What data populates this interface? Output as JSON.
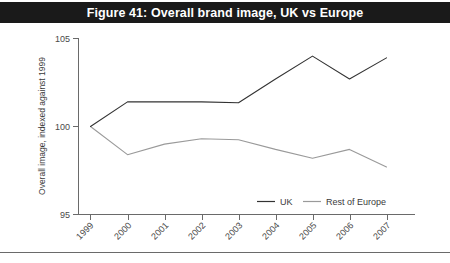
{
  "figure": {
    "title": "Figure 41: Overall brand image, UK vs Europe",
    "title_bg": "#1a1a1a",
    "title_fg": "#ffffff"
  },
  "chart_data": {
    "type": "line",
    "title": "Figure 41: Overall brand image, UK vs Europe",
    "xlabel": "",
    "ylabel": "Overall image, indexed against 1999",
    "categories": [
      "1999",
      "2000",
      "2001",
      "2002",
      "2003",
      "2004",
      "2005",
      "2006",
      "2007"
    ],
    "x_tick_labels": [
      "1999",
      "2000",
      "2001",
      "2002",
      "2003",
      "2004",
      "2005",
      "2006",
      "2007"
    ],
    "y_tick_labels": [
      "95",
      "100",
      "105"
    ],
    "y_ticks": [
      95,
      100,
      105
    ],
    "ylim": [
      95,
      105
    ],
    "grid": false,
    "legend_position": "bottom-right",
    "series": [
      {
        "name": "UK",
        "color": "#333333",
        "values": [
          100.0,
          101.4,
          101.4,
          101.4,
          101.35,
          102.7,
          104.0,
          102.7,
          103.9
        ]
      },
      {
        "name": "Rest of Europe",
        "color": "#9a9a9a",
        "values": [
          100.0,
          98.4,
          99.0,
          99.3,
          99.25,
          98.7,
          98.2,
          98.7,
          97.7
        ]
      }
    ]
  },
  "legend": {
    "items": [
      {
        "label": "UK",
        "color": "#333333"
      },
      {
        "label": "Rest of Europe",
        "color": "#9a9a9a"
      }
    ]
  }
}
